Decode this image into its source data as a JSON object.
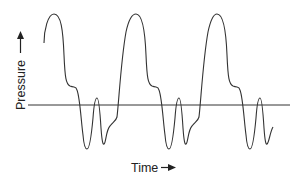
{
  "diagram": {
    "title": "",
    "y_axis_label": "Pressure",
    "x_axis_label": "Time",
    "colors": {
      "line": "#333333",
      "baseline": "#333333",
      "text": "#222222",
      "background": "#ffffff"
    },
    "baseline": {
      "x1": 28,
      "x2": 290,
      "y": 105
    },
    "waveform": {
      "description": "Periodic pressure waveform with 3 cycles: tall peak, shoulder, two negative troughs separated by a small positive bump",
      "cycles": 3
    }
  }
}
